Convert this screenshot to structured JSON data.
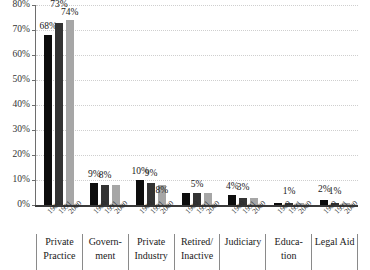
{
  "chart_data": {
    "type": "bar",
    "title": "",
    "subtitle": "",
    "xlabel": "",
    "ylabel": "",
    "ylim": [
      0,
      80
    ],
    "y_tick_labels": [
      "0%",
      "10%",
      "20%",
      "30%",
      "40%",
      "50%",
      "60%",
      "70%",
      "80%"
    ],
    "y_ticks": [
      0,
      10,
      20,
      30,
      40,
      50,
      60,
      70,
      80
    ],
    "grid": true,
    "legend": "none",
    "categories": [
      "Private Practice",
      "Government",
      "Private Industry",
      "Retired/ Inactive",
      "Judiciary",
      "Education",
      "Legal Aid"
    ],
    "series": [
      {
        "name": "1980",
        "color": "#0d0d0d",
        "values": [
          68,
          9,
          10,
          5,
          4,
          1,
          2
        ]
      },
      {
        "name": "1991",
        "color": "#333333",
        "values": [
          73,
          8,
          9,
          5,
          3,
          1,
          1
        ]
      },
      {
        "name": "2000",
        "color": "#a6a6a6",
        "values": [
          74,
          8,
          8,
          5,
          3,
          1,
          1
        ]
      }
    ]
  },
  "axis": {
    "y_labels": [
      "80%",
      "70%",
      "60%",
      "50%",
      "40%",
      "30%",
      "20%",
      "10%",
      "0%"
    ]
  },
  "groups": [
    {
      "category_lines": [
        "Private",
        "Practice"
      ],
      "bars": [
        {
          "year": "1980",
          "value": 68,
          "label": "68%",
          "show_label": true,
          "label_offset": 4
        },
        {
          "year": "1991",
          "value": 73,
          "label": "73%",
          "show_label": true,
          "label_offset": 14
        },
        {
          "year": "2000",
          "value": 74,
          "label": "74%",
          "show_label": true,
          "label_offset": 3
        }
      ]
    },
    {
      "category_lines": [
        "Govern-",
        "ment"
      ],
      "bars": [
        {
          "year": "1980",
          "value": 9,
          "label": "9%",
          "show_label": true,
          "label_offset": 4
        },
        {
          "year": "1991",
          "value": 8,
          "label": "8%",
          "show_label": true,
          "label_offset": 5
        },
        {
          "year": "2000",
          "value": 8,
          "label": "",
          "show_label": false,
          "label_offset": 0
        }
      ]
    },
    {
      "category_lines": [
        "Private",
        "Industry"
      ],
      "bars": [
        {
          "year": "1980",
          "value": 10,
          "label": "10%",
          "show_label": true,
          "label_offset": 4
        },
        {
          "year": "1991",
          "value": 9,
          "label": "9%",
          "show_label": true,
          "label_offset": 5
        },
        {
          "year": "2000",
          "value": 8,
          "label": "8%",
          "show_label": true,
          "label_offset": -10
        }
      ]
    },
    {
      "category_lines": [
        "Retired/",
        "Inactive"
      ],
      "bars": [
        {
          "year": "1980",
          "value": 5,
          "label": "",
          "show_label": false,
          "label_offset": 0
        },
        {
          "year": "1991",
          "value": 5,
          "label": "5%",
          "show_label": true,
          "label_offset": 4
        },
        {
          "year": "2000",
          "value": 5,
          "label": "",
          "show_label": false,
          "label_offset": 0
        }
      ]
    },
    {
      "category_lines": [
        "Judiciary"
      ],
      "bars": [
        {
          "year": "1980",
          "value": 4,
          "label": "4%",
          "show_label": true,
          "label_offset": 4
        },
        {
          "year": "1991",
          "value": 3,
          "label": "3%",
          "show_label": true,
          "label_offset": 6
        },
        {
          "year": "2000",
          "value": 3,
          "label": "",
          "show_label": false,
          "label_offset": 0
        }
      ]
    },
    {
      "category_lines": [
        "Educa-",
        "tion"
      ],
      "bars": [
        {
          "year": "1980",
          "value": 1,
          "label": "",
          "show_label": false,
          "label_offset": 0
        },
        {
          "year": "1991",
          "value": 1,
          "label": "1%",
          "show_label": true,
          "label_offset": 7
        },
        {
          "year": "2000",
          "value": 1,
          "label": "",
          "show_label": false,
          "label_offset": 0
        }
      ]
    },
    {
      "category_lines": [
        "Legal Aid"
      ],
      "bars": [
        {
          "year": "1980",
          "value": 2,
          "label": "2%",
          "show_label": true,
          "label_offset": 6
        },
        {
          "year": "1991",
          "value": 1,
          "label": "1%",
          "show_label": true,
          "label_offset": 7
        },
        {
          "year": "2000",
          "value": 1,
          "label": "",
          "show_label": false,
          "label_offset": 0
        }
      ]
    }
  ]
}
